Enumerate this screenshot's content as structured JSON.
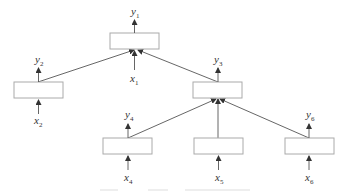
{
  "diagram": {
    "type": "tree-structured recursive network",
    "nodes": [
      {
        "id": "n1",
        "output": {
          "base": "y",
          "sub": "1"
        },
        "input": {
          "base": "x",
          "sub": "1"
        }
      },
      {
        "id": "n2",
        "output": {
          "base": "y",
          "sub": "2"
        },
        "input": {
          "base": "x",
          "sub": "2"
        }
      },
      {
        "id": "n3",
        "output": {
          "base": "y",
          "sub": "3"
        },
        "input": null
      },
      {
        "id": "n4",
        "output": {
          "base": "y",
          "sub": "4"
        },
        "input": {
          "base": "x",
          "sub": "4"
        }
      },
      {
        "id": "n5",
        "output": null,
        "input": {
          "base": "x",
          "sub": "5"
        }
      },
      {
        "id": "n6",
        "output": {
          "base": "y",
          "sub": "6"
        },
        "input": {
          "base": "x",
          "sub": "6"
        }
      }
    ],
    "edges": [
      {
        "from": "n2",
        "to": "n1"
      },
      {
        "from": "n3",
        "to": "n1"
      },
      {
        "from": "n4",
        "to": "n3"
      },
      {
        "from": "n5",
        "to": "n3"
      },
      {
        "from": "n6",
        "to": "n3"
      }
    ],
    "caption": "(faint, illegible caption text)"
  },
  "colors": {
    "box_stroke": "#aaaaaa",
    "edge": "#555555",
    "text": "#333333"
  }
}
